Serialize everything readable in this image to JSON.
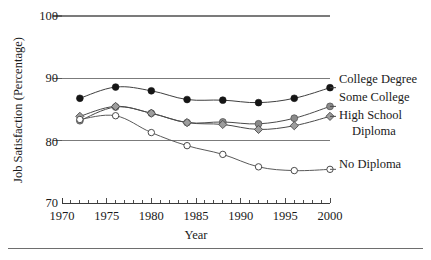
{
  "chart_data": {
    "type": "line",
    "title": "",
    "subtitle": "",
    "xlabel": "Year",
    "ylabel": "Job Satisfaction (Percentage)",
    "xlim": [
      1970,
      2000
    ],
    "ylim": [
      70,
      100
    ],
    "grid": "horizontal-major-only",
    "legend_position": "right-inline",
    "y_ticks": [
      70,
      80,
      90,
      100
    ],
    "y_tick_labels": [
      "70",
      "80",
      "90",
      "100"
    ],
    "x_ticks": [
      1970,
      1975,
      1980,
      1985,
      1990,
      1995,
      2000
    ],
    "x_tick_labels": [
      "1970",
      "1975",
      "1980",
      "1985",
      "1990",
      "1995",
      "2000"
    ],
    "x_minor_tick_step": 1,
    "x": [
      1972,
      1976,
      1980,
      1984,
      1988,
      1992,
      1996,
      2000
    ],
    "series": [
      {
        "name": "College Degree",
        "marker": "filled-circle",
        "marker_color": "#151515",
        "line_color": "#3f3f3f",
        "values": [
          86.8,
          88.6,
          88.0,
          86.6,
          86.5,
          86.1,
          86.8,
          88.5
        ]
      },
      {
        "name": "Some College",
        "marker": "filled-circle",
        "marker_color": "#8a8a8a",
        "line_color": "#4a4a4a",
        "values": [
          83.2,
          85.4,
          84.4,
          82.9,
          83.0,
          82.7,
          83.6,
          85.5
        ]
      },
      {
        "name": "High School Diploma",
        "marker": "filled-diamond",
        "marker_color": "#9e9e9e",
        "line_color": "#4a4a4a",
        "values": [
          83.9,
          85.5,
          84.4,
          82.9,
          82.6,
          81.8,
          82.4,
          83.9
        ]
      },
      {
        "name": "No Diploma",
        "marker": "open-circle",
        "marker_color": "#ffffff",
        "line_color": "#5a5a5a",
        "values": [
          83.4,
          84.0,
          81.3,
          79.2,
          77.8,
          75.8,
          75.2,
          75.4
        ]
      }
    ],
    "legend_entries": [
      {
        "label": "College Degree",
        "label_line2": "",
        "marker": "filled-circle"
      },
      {
        "label": "Some College",
        "label_line2": "",
        "marker": "filled-circle"
      },
      {
        "label": "High School",
        "label_line2": "Diploma",
        "marker": "filled-diamond"
      },
      {
        "label": "No Diploma",
        "label_line2": "",
        "marker": "open-circle"
      }
    ]
  },
  "colors": {
    "background": "#ffffff",
    "gridline": "#7b7b7b",
    "axis": "#3a3a3a",
    "text": "#1a1a1a",
    "college_degree": "#151515",
    "some_college": "#8a8a8a",
    "high_school": "#9e9e9e",
    "no_diploma": "#ffffff"
  },
  "axes": {
    "y_label": "Job Satisfaction (Percentage)",
    "x_label": "Year",
    "y_tick_100": "100",
    "y_tick_90": "90",
    "y_tick_80": "80",
    "y_tick_70": "70",
    "x_tick_1970": "1970",
    "x_tick_1975": "1975",
    "x_tick_1980": "1980",
    "x_tick_1985": "1985",
    "x_tick_1990": "1990",
    "x_tick_1995": "1995",
    "x_tick_2000": "2000"
  },
  "legend": {
    "item_college_degree": "College Degree",
    "item_some_college": "Some College",
    "item_high_school_line1": "High School",
    "item_high_school_line2": "Diploma",
    "item_no_diploma": "No Diploma"
  }
}
